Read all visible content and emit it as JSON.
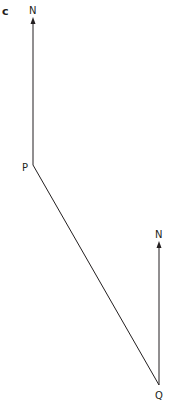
{
  "part_label": "c",
  "points": {
    "P": "P",
    "Q": "Q"
  },
  "north_labels": [
    "N",
    "N"
  ]
}
